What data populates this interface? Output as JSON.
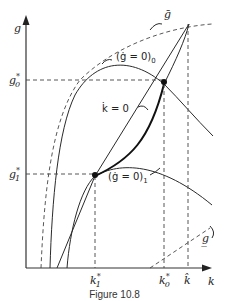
{
  "diagram": {
    "axes": {
      "y_label": "g",
      "x_label": "k"
    },
    "y_ticks": [
      {
        "label": "g",
        "sup": "*",
        "sub": "0"
      },
      {
        "label": "g",
        "sup": "*",
        "sub": "1"
      }
    ],
    "x_ticks": [
      {
        "label": "k",
        "sup": "*",
        "sub": "1"
      },
      {
        "label": "k",
        "sup": "*",
        "sub": "0"
      },
      {
        "label": "k̂"
      }
    ],
    "curves": [
      {
        "name": "g-bar",
        "label": "ḡ",
        "style": "dashed"
      },
      {
        "name": "g-dot-zero-0",
        "label": "(ġ = 0)",
        "sub": "0",
        "style": "solid"
      },
      {
        "name": "k-dot-zero",
        "label": "k̇ = 0",
        "style": "solid"
      },
      {
        "name": "g-dot-zero-1",
        "label": "(ġ = 0)",
        "sub": "1",
        "style": "solid"
      },
      {
        "name": "g-underbar",
        "label": "g̲",
        "style": "dashed"
      },
      {
        "name": "saddle-path",
        "label": "",
        "style": "thick"
      }
    ],
    "equilibria": [
      "E0",
      "E1"
    ],
    "caption": "Figure 10.8"
  }
}
